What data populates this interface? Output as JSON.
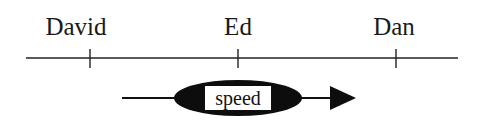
{
  "timeline": {
    "labels": [
      {
        "text": "David",
        "x": 90
      },
      {
        "text": "Ed",
        "x": 238
      },
      {
        "text": "Dan",
        "x": 396
      }
    ],
    "axis": {
      "x1": 26,
      "x2": 458,
      "y": 58,
      "tick_half_height": 9
    }
  },
  "vector": {
    "label": "speed",
    "ellipse": {
      "cx": 238,
      "cy": 98,
      "rx": 64,
      "ry": 18
    },
    "line": {
      "x1": 122,
      "x2": 330,
      "y": 98
    },
    "arrowhead": {
      "tip_x": 356,
      "base_x": 330,
      "half_height": 12
    }
  },
  "colors": {
    "ink": "#111111",
    "background": "#ffffff"
  }
}
